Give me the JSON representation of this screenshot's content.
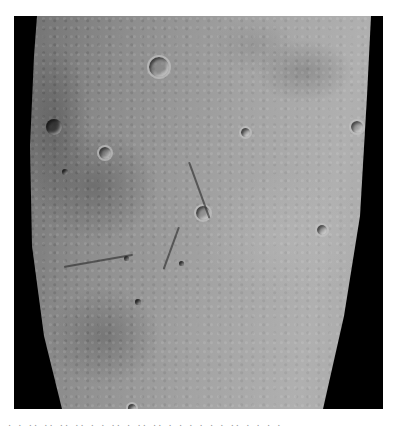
{
  "image": {
    "subject": "lunar surface photograph",
    "description": "Grayscale orbital view of cratered lunar terrain with dark mare basin on the left and black space borders on both sides",
    "colors": {
      "space": "#000000",
      "highland": "#a8a8a8",
      "mare": "#6a6a6a",
      "background": "#ffffff"
    },
    "features": [
      {
        "type": "crater",
        "style": "dark",
        "x": 54,
        "y": 127,
        "r": 8
      },
      {
        "type": "crater",
        "style": "ring",
        "x": 103,
        "y": 151,
        "r": 6
      },
      {
        "type": "crater",
        "style": "ring",
        "x": 157,
        "y": 65,
        "r": 10
      },
      {
        "type": "crater",
        "style": "ring",
        "x": 201,
        "y": 211,
        "r": 7
      },
      {
        "type": "crater",
        "style": "dark",
        "x": 65,
        "y": 172,
        "r": 3
      },
      {
        "type": "crater",
        "style": "ring",
        "x": 320,
        "y": 228,
        "r": 5
      },
      {
        "type": "crater",
        "style": "ring",
        "x": 355,
        "y": 125,
        "r": 6
      },
      {
        "type": "crater",
        "style": "dark",
        "x": 138,
        "y": 302,
        "r": 3
      },
      {
        "type": "crater",
        "style": "ring",
        "x": 130,
        "y": 410,
        "r": 4
      }
    ]
  },
  "caption": {
    "text": "· · ·· ·· ·· ·· ·  ·  ·· ·  ··  ·· · ·  · ·  ·  ·  ·· · · · ·"
  }
}
